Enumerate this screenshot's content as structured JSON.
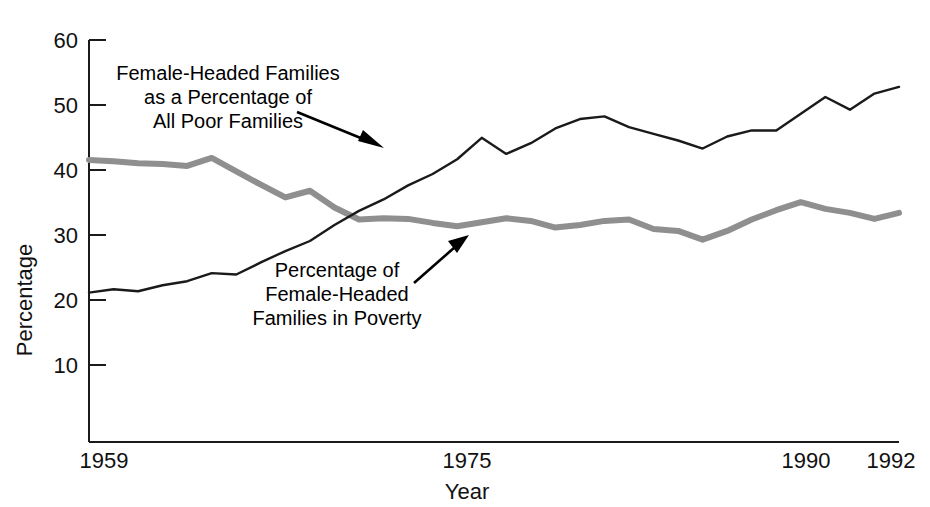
{
  "chart_data": {
    "type": "line",
    "title": "",
    "xlabel": "Year",
    "ylabel": "Percentage",
    "xlim": [
      1959,
      1992
    ],
    "ylim": [
      0,
      60
    ],
    "yticks": [
      10,
      20,
      30,
      40,
      50,
      60
    ],
    "xticks": [
      1959,
      1975,
      1990,
      1992
    ],
    "grid": false,
    "legend": "annotations",
    "x": [
      1959,
      1960,
      1961,
      1962,
      1963,
      1964,
      1965,
      1966,
      1967,
      1968,
      1969,
      1970,
      1971,
      1972,
      1973,
      1974,
      1975,
      1976,
      1977,
      1978,
      1979,
      1980,
      1981,
      1982,
      1983,
      1984,
      1985,
      1986,
      1987,
      1988,
      1989,
      1990,
      1991,
      1992
    ],
    "series": [
      {
        "name": "Female-Headed Families as a Percentage of All Poor Families",
        "color": "#1a1a1a",
        "style": "thin-dark",
        "values": [
          22.3,
          22.8,
          22.5,
          23.4,
          24.0,
          25.2,
          25.0,
          26.8,
          28.5,
          30.0,
          32.4,
          34.5,
          36.2,
          38.3,
          40.0,
          42.2,
          45.4,
          43.0,
          44.6,
          46.8,
          48.2,
          48.6,
          47.0,
          46.0,
          45.0,
          43.8,
          45.6,
          46.5,
          46.5,
          49.0,
          51.5,
          49.6,
          52.0,
          53.0
        ]
      },
      {
        "name": "Percentage of Female-Headed Families in Poverty",
        "color": "#8f8f8f",
        "style": "thick-gray",
        "values": [
          42.1,
          41.9,
          41.6,
          41.5,
          41.2,
          42.4,
          40.4,
          38.4,
          36.5,
          37.5,
          35.0,
          33.2,
          33.4,
          33.3,
          32.7,
          32.2,
          32.8,
          33.4,
          33.0,
          32.0,
          32.4,
          33.0,
          33.2,
          31.8,
          31.5,
          30.2,
          31.5,
          33.2,
          34.6,
          35.8,
          34.8,
          34.2,
          33.3,
          34.2
        ],
        "note": "Values expressed as percentage of female-headed families living below poverty line."
      }
    ],
    "annotations": [
      {
        "id": "annotation-poor-families",
        "lines": [
          "Female-Headed Families",
          "as a Percentage of",
          "All Poor Families"
        ],
        "target_series": "Female-Headed Families as a Percentage of All Poor Families"
      },
      {
        "id": "annotation-in-poverty",
        "lines": [
          "Percentage of",
          "Female-Headed",
          "Families in Poverty"
        ],
        "target_series": "Percentage of Female-Headed Families in Poverty"
      }
    ]
  },
  "axes": {
    "y_title": "Percentage",
    "x_title": "Year",
    "y_tick_labels": [
      "60",
      "50",
      "40",
      "30",
      "20",
      "10"
    ],
    "x_tick_labels": [
      "1959",
      "1975",
      "1990",
      "1992"
    ]
  },
  "colors": {
    "dark_series": "#1a1a1a",
    "gray_series": "#8f8f8f",
    "axis": "#1a1a1a",
    "background": "#ffffff",
    "text": "#111111"
  }
}
